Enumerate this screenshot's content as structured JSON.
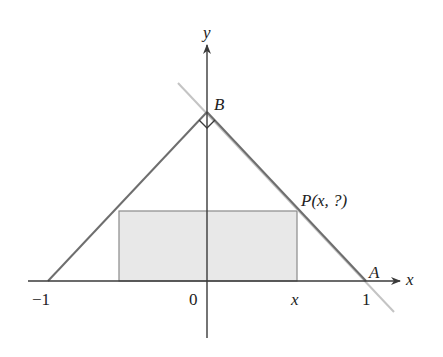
{
  "diagram": {
    "title": "",
    "axes": {
      "x_label": "x",
      "y_label": "y"
    },
    "ticks": {
      "neg_one": "−1",
      "zero": "0",
      "x": "x",
      "one": "1"
    },
    "points": {
      "A": "A",
      "B": "B",
      "P": "P(x, ?)"
    },
    "shapes": {
      "triangle": {
        "vertices": [
          [
            -1,
            0
          ],
          [
            0,
            1.06
          ],
          [
            1,
            0
          ]
        ]
      },
      "shaded_rectangle": {
        "x_from": -0.557,
        "x_to": 0.557,
        "y_from": 0,
        "y_to": 0.44
      },
      "extended_line_through_AB": true,
      "right_angle_at": "B"
    },
    "colors": {
      "axis": "#3a3a3a",
      "triangle_side": "#6e6e6e",
      "extended_line": "#c4c4c4",
      "rectangle_fill": "#e8e8e8",
      "rectangle_stroke": "#8a8a8a",
      "text": "#222222"
    }
  }
}
